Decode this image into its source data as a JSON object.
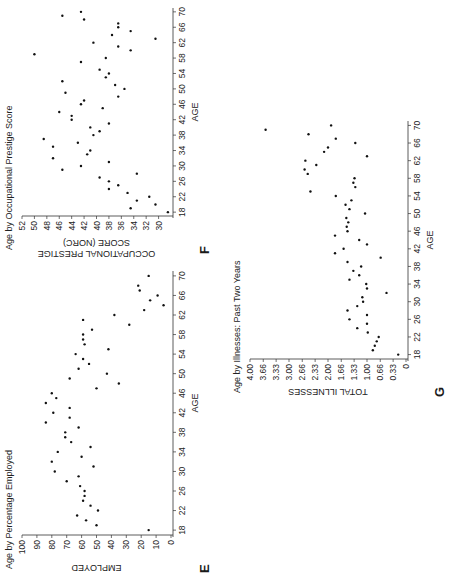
{
  "chart_data": [
    {
      "id": "E",
      "type": "scatter",
      "panel_label": "E",
      "title": "Age by Percentage Employed",
      "xlabel": "AGE",
      "ylabel": "EMPLOYED",
      "x_ticks": [
        18,
        22,
        26,
        30,
        34,
        38,
        42,
        46,
        50,
        54,
        58,
        62,
        66,
        70
      ],
      "y_ticks": [
        0,
        10,
        20,
        30,
        40,
        50,
        60,
        70,
        80,
        90,
        100
      ],
      "y_tick_labels": [
        "0",
        "10",
        "20",
        "30",
        "40",
        "50",
        "60",
        "70",
        "80",
        "90",
        "100"
      ],
      "xlim": [
        17,
        71
      ],
      "ylim": [
        0,
        100
      ],
      "grid": false,
      "points": [
        [
          18,
          15
        ],
        [
          19,
          50
        ],
        [
          20,
          57
        ],
        [
          21,
          63
        ],
        [
          22,
          49
        ],
        [
          23,
          54
        ],
        [
          24,
          59
        ],
        [
          25,
          58
        ],
        [
          26,
          58
        ],
        [
          27,
          61
        ],
        [
          28,
          70
        ],
        [
          29,
          62
        ],
        [
          30,
          78
        ],
        [
          31,
          52
        ],
        [
          32,
          80
        ],
        [
          33,
          60
        ],
        [
          34,
          76
        ],
        [
          35,
          54
        ],
        [
          36,
          67
        ],
        [
          37,
          71
        ],
        [
          38,
          71
        ],
        [
          39,
          62
        ],
        [
          40,
          84
        ],
        [
          41,
          68
        ],
        [
          42,
          79
        ],
        [
          43,
          68
        ],
        [
          44,
          84
        ],
        [
          45,
          77
        ],
        [
          46,
          80
        ],
        [
          47,
          50
        ],
        [
          48,
          35
        ],
        [
          49,
          68
        ],
        [
          50,
          43
        ],
        [
          51,
          62
        ],
        [
          52,
          55
        ],
        [
          53,
          59
        ],
        [
          54,
          64
        ],
        [
          55,
          42
        ],
        [
          56,
          58
        ],
        [
          57,
          59
        ],
        [
          58,
          59
        ],
        [
          59,
          53
        ],
        [
          60,
          28
        ],
        [
          61,
          59
        ],
        [
          62,
          38
        ],
        [
          63,
          18
        ],
        [
          64,
          5
        ],
        [
          65,
          14
        ],
        [
          66,
          9
        ],
        [
          67,
          21
        ],
        [
          68,
          22
        ],
        [
          70,
          15
        ]
      ]
    },
    {
      "id": "F",
      "type": "scatter",
      "panel_label": "F",
      "title": "Age by Occupational Prestige Score",
      "xlabel": "AGE",
      "ylabel": "OCCUPATIONAL PRESTIGE SCORE (NORC)",
      "ylabel_lines": [
        "OCCUPATIONAL PRESTIGE",
        "SCORE (NORC)"
      ],
      "x_ticks": [
        18,
        22,
        26,
        30,
        34,
        38,
        42,
        46,
        50,
        54,
        58,
        62,
        66,
        70
      ],
      "y_ticks": [
        30,
        32,
        34,
        36,
        38,
        40,
        42,
        44,
        46,
        48,
        50,
        52
      ],
      "y_tick_labels": [
        "30",
        "32",
        "34",
        "36",
        "38",
        "40",
        "42",
        "44",
        "46",
        "48",
        "50",
        "52"
      ],
      "xlim": [
        17,
        71
      ],
      "ylim": [
        28,
        52
      ],
      "grid": false,
      "points": [
        [
          18,
          28.5
        ],
        [
          19,
          34.5
        ],
        [
          20,
          30.5
        ],
        [
          21,
          33.5
        ],
        [
          22,
          31.5
        ],
        [
          23,
          35
        ],
        [
          24,
          38
        ],
        [
          25,
          36.5
        ],
        [
          26,
          38
        ],
        [
          27,
          39.5
        ],
        [
          28,
          33.5
        ],
        [
          29,
          45.5
        ],
        [
          30,
          42.5
        ],
        [
          31,
          38
        ],
        [
          32,
          47
        ],
        [
          33,
          41.5
        ],
        [
          34,
          41
        ],
        [
          35,
          47
        ],
        [
          36,
          43
        ],
        [
          37,
          48.5
        ],
        [
          38,
          40.5
        ],
        [
          39,
          39.5
        ],
        [
          40,
          41
        ],
        [
          41,
          38
        ],
        [
          42,
          44
        ],
        [
          43,
          44
        ],
        [
          44,
          46
        ],
        [
          45,
          39
        ],
        [
          46,
          42.5
        ],
        [
          47,
          42
        ],
        [
          48,
          36.5
        ],
        [
          49,
          45
        ],
        [
          50,
          35.5
        ],
        [
          51,
          37
        ],
        [
          52,
          45.5
        ],
        [
          53,
          38.5
        ],
        [
          54,
          38
        ],
        [
          55,
          39.5
        ],
        [
          57,
          42.5
        ],
        [
          58,
          38.5
        ],
        [
          59,
          50
        ],
        [
          60,
          34.5
        ],
        [
          61,
          36.5
        ],
        [
          62,
          40.5
        ],
        [
          63,
          30.5
        ],
        [
          64,
          37.5
        ],
        [
          65,
          34.5
        ],
        [
          66,
          36.5
        ],
        [
          67,
          36.5
        ],
        [
          68,
          42
        ],
        [
          69,
          45.5
        ],
        [
          70,
          42.5
        ]
      ]
    },
    {
      "id": "G",
      "type": "scatter",
      "panel_label": "G",
      "title": "Age by Illnesses:  Past Two Years",
      "xlabel": "AGE",
      "ylabel": "TOTAL ILLNESSES",
      "x_ticks": [
        18,
        22,
        26,
        30,
        34,
        38,
        42,
        46,
        50,
        54,
        58,
        62,
        66,
        70
      ],
      "y_ticks": [
        0,
        0.33,
        0.66,
        1.0,
        1.33,
        1.66,
        2.0,
        2.33,
        2.66,
        3.0,
        3.33,
        3.66,
        4.0
      ],
      "y_tick_labels": [
        "0",
        "0.33",
        "0.66",
        "1.00",
        "1.33",
        "1.66",
        "2.00",
        "2.33",
        "2.66",
        "3.00",
        "3.33",
        "3.66",
        "4.00"
      ],
      "xlim": [
        17,
        71
      ],
      "ylim": [
        0,
        4
      ],
      "grid": false,
      "points": [
        [
          18,
          0.2
        ],
        [
          19,
          0.85
        ],
        [
          20,
          0.8
        ],
        [
          21,
          0.75
        ],
        [
          22,
          0.7
        ],
        [
          23,
          0.98
        ],
        [
          24,
          1.25
        ],
        [
          25,
          1.0
        ],
        [
          26,
          1.45
        ],
        [
          27,
          1.0
        ],
        [
          28,
          1.5
        ],
        [
          29,
          1.25
        ],
        [
          30,
          1.1
        ],
        [
          31,
          1.12
        ],
        [
          32,
          0.5
        ],
        [
          33,
          1.0
        ],
        [
          34,
          1.02
        ],
        [
          35,
          1.45
        ],
        [
          36,
          1.2
        ],
        [
          37,
          1.35
        ],
        [
          38,
          1.15
        ],
        [
          39,
          1.5
        ],
        [
          40,
          0.65
        ],
        [
          41,
          1.82
        ],
        [
          42,
          1.6
        ],
        [
          43,
          1.0
        ],
        [
          44,
          1.2
        ],
        [
          45,
          1.82
        ],
        [
          46,
          1.5
        ],
        [
          47,
          1.52
        ],
        [
          48,
          1.48
        ],
        [
          49,
          1.53
        ],
        [
          50,
          1.05
        ],
        [
          51,
          1.45
        ],
        [
          52,
          1.55
        ],
        [
          53,
          1.4
        ],
        [
          54,
          1.8
        ],
        [
          55,
          2.45
        ],
        [
          56,
          1.3
        ],
        [
          57,
          1.35
        ],
        [
          58,
          1.32
        ],
        [
          59,
          2.52
        ],
        [
          60,
          2.6
        ],
        [
          61,
          2.3
        ],
        [
          62,
          2.58
        ],
        [
          63,
          1.0
        ],
        [
          64,
          2.1
        ],
        [
          65,
          2.0
        ],
        [
          66,
          1.3
        ],
        [
          67,
          1.8
        ],
        [
          68,
          2.5
        ],
        [
          69,
          3.6
        ],
        [
          70,
          1.92
        ]
      ]
    }
  ],
  "panels": {
    "E": {
      "letter": "E"
    },
    "F": {
      "letter": "F"
    },
    "G": {
      "letter": "G"
    }
  }
}
